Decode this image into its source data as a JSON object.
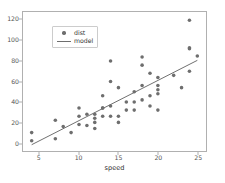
{
  "figure": {
    "background_color": "#ffffff",
    "axes_edge_color": "#b0b0b0",
    "marker_color": "#6e6e6e",
    "line_color": "#6e6e6e",
    "tick_label_color": "#555555"
  },
  "legend": {
    "entries": [
      {
        "label": "dist",
        "key": "marker-dot",
        "color": "#6e6e6e"
      },
      {
        "label": "model",
        "key": "line-segment",
        "color": "#6e6e6e"
      }
    ]
  },
  "chart_data": {
    "type": "scatter",
    "title": "",
    "xlabel": "speed",
    "ylabel": "",
    "grid": false,
    "legend_position": "upper left",
    "xlim": [
      2.9,
      26.1
    ],
    "ylim": [
      -8.0,
      128.0
    ],
    "xticks": [
      5,
      10,
      15,
      20,
      25
    ],
    "yticks": [
      0,
      20,
      40,
      60,
      80,
      100,
      120
    ],
    "xtick_labels": [
      "5",
      "10",
      "15",
      "20",
      "25"
    ],
    "ytick_labels": [
      "0",
      "20",
      "40",
      "60",
      "80",
      "100",
      "120"
    ],
    "series": [
      {
        "name": "dist",
        "type": "scatter",
        "color": "#6e6e6e",
        "marker": "circle",
        "marker_size": 3.6,
        "x": [
          4,
          4,
          7,
          7,
          8,
          9,
          10,
          10,
          10,
          11,
          11,
          12,
          12,
          12,
          12,
          13,
          13,
          13,
          13,
          14,
          14,
          14,
          14,
          15,
          15,
          15,
          16,
          16,
          17,
          17,
          17,
          18,
          18,
          18,
          18,
          19,
          19,
          19,
          20,
          20,
          20,
          20,
          20,
          22,
          23,
          24,
          24,
          24,
          24,
          25
        ],
        "y": [
          2,
          10,
          4,
          22,
          16,
          10,
          18,
          26,
          34,
          17,
          28,
          14,
          20,
          24,
          28,
          26,
          34,
          34,
          46,
          26,
          36,
          60,
          80,
          20,
          26,
          54,
          32,
          40,
          32,
          40,
          50,
          42,
          56,
          76,
          84,
          36,
          46,
          68,
          32,
          48,
          52,
          56,
          64,
          66,
          54,
          70,
          92,
          93,
          120,
          85
        ]
      },
      {
        "name": "model",
        "type": "line",
        "color": "#6e6e6e",
        "linewidth": 1,
        "x": [
          4,
          25
        ],
        "y": [
          -1.85,
          80.69
        ],
        "fit": {
          "intercept": -17.5791,
          "slope": 3.9324
        }
      }
    ]
  }
}
